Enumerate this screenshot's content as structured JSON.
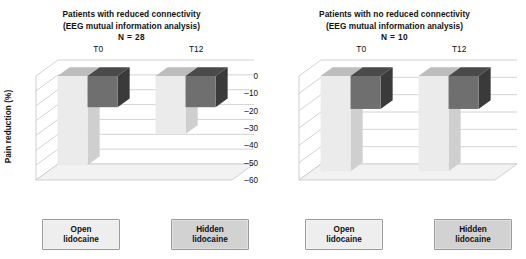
{
  "figure": {
    "ylabel": "Pain reduction (%)",
    "series_names": [
      "Open lidocaine",
      "Hidden lidocaine"
    ],
    "colors": {
      "open_front": "#ebebeb",
      "open_top": "#bdbdbd",
      "open_side": "#cfcfcf",
      "hidden_front": "#6f6f6f",
      "hidden_top": "#4a4a4a",
      "hidden_side": "#3a3a3a",
      "grid": "#c8c8c8",
      "floor": "#f2f2f2"
    }
  },
  "panels": [
    {
      "title_line1": "Patients with reduced connectivity",
      "title_line2": "(EEG mutual information analysis)",
      "title_line3": "N = 28",
      "legend": {
        "open_line1": "Open",
        "open_line2": "lidocaine",
        "hidden_line1": "Hidden",
        "hidden_line2": "lidocaine"
      },
      "yticks": [
        "0",
        "–10",
        "–20",
        "–30",
        "–40",
        "–50",
        "–60",
        "–70"
      ],
      "categories": [
        "T0",
        "T12"
      ],
      "chart_data": {
        "type": "bar",
        "title": "Patients with reduced connectivity (EEG mutual information analysis) N = 28",
        "xlabel": "",
        "ylabel": "Pain reduction (%)",
        "ylim": [
          -70,
          0
        ],
        "yticks": [
          0,
          -10,
          -20,
          -30,
          -40,
          -50,
          -60,
          -70
        ],
        "grid": true,
        "legend_position": "bottom",
        "categories": [
          "T0",
          "T12"
        ],
        "series": [
          {
            "name": "Open lidocaine",
            "values": [
              -60,
              -39
            ]
          },
          {
            "name": "Hidden lidocaine",
            "values": [
              -21,
              -21
            ]
          }
        ]
      }
    },
    {
      "title_line1": "Patients with no reduced connectivity",
      "title_line2": "(EEG mutual information analysis)",
      "title_line3": "N = 10",
      "legend": {
        "open_line1": "Open",
        "open_line2": "lidocaine",
        "hidden_line1": "Hidden",
        "hidden_line2": "lidocaine"
      },
      "yticks": [
        "0",
        "–10",
        "–20",
        "–30",
        "–40",
        "–50",
        "–60"
      ],
      "categories": [
        "T0",
        "T12"
      ],
      "chart_data": {
        "type": "bar",
        "title": "Patients with no reduced connectivity (EEG mutual information analysis) N = 10",
        "xlabel": "",
        "ylabel": "Pain reduction (%)",
        "ylim": [
          -60,
          0
        ],
        "yticks": [
          0,
          -10,
          -20,
          -30,
          -40,
          -50,
          -60
        ],
        "grid": true,
        "legend_position": "bottom",
        "categories": [
          "T0",
          "T12"
        ],
        "series": [
          {
            "name": "Open lidocaine",
            "values": [
              -55,
              -55
            ]
          },
          {
            "name": "Hidden lidocaine",
            "values": [
              -19,
              -19
            ]
          }
        ]
      }
    }
  ]
}
